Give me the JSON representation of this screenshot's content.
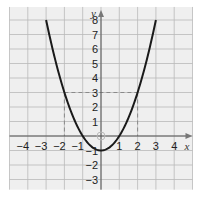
{
  "chart_data": {
    "type": "line",
    "title": "",
    "xlabel": "x",
    "ylabel": "y",
    "function": "y = x^2 - 1",
    "xlim": [
      -5,
      5
    ],
    "ylim": [
      -3.7,
      8.9
    ],
    "grid": true,
    "x_ticks": [
      -4,
      -3,
      -2,
      -1,
      1,
      2,
      3,
      4
    ],
    "x_tick_labels": [
      "−4",
      "−3",
      "−2",
      "−1",
      "1",
      "2",
      "3",
      "4"
    ],
    "y_ticks": [
      8,
      7,
      6,
      5,
      4,
      3,
      2,
      1,
      -1,
      -2,
      -3
    ],
    "y_tick_labels": [
      "8",
      "7",
      "6",
      "5",
      "4",
      "3",
      "2",
      "1",
      "−1",
      "−2",
      "−3"
    ],
    "series": [
      {
        "name": "parabola",
        "x": [
          -3,
          -2.5,
          -2,
          -1.5,
          -1,
          -0.5,
          0,
          0.5,
          1,
          1.5,
          2,
          2.5,
          3
        ],
        "values": [
          8,
          5.25,
          3,
          1.25,
          0,
          -0.75,
          -1,
          -0.75,
          0,
          1.25,
          3,
          5.25,
          8
        ]
      }
    ],
    "annotations": [
      {
        "type": "dashed-line",
        "from": [
          -2,
          3
        ],
        "to": [
          2,
          3
        ]
      },
      {
        "type": "dashed-line",
        "from": [
          -2,
          3
        ],
        "to": [
          -2,
          0
        ]
      },
      {
        "type": "dashed-line",
        "from": [
          2,
          3
        ],
        "to": [
          2,
          0
        ]
      },
      {
        "type": "circle-marker",
        "at": [
          0,
          0
        ]
      }
    ]
  },
  "colors": {
    "grid_bg": "#efefef",
    "grid_line": "#b9b9b9",
    "axis": "#555555",
    "curve": "#1a1a1a",
    "dashed": "#8a8a8a"
  }
}
